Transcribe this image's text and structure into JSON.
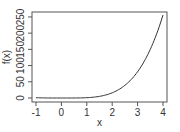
{
  "chart_data": {
    "type": "line",
    "title": "",
    "xlabel": "x",
    "ylabel": "f(x)",
    "xlim": [
      -1,
      4
    ],
    "ylim": [
      0,
      256
    ],
    "x_ticks": [
      -1,
      0,
      1,
      2,
      3,
      4
    ],
    "x_tick_labels": [
      "-1",
      "0",
      "1",
      "2",
      "3",
      "4"
    ],
    "y_ticks": [
      0,
      50,
      100,
      150,
      200,
      250
    ],
    "y_tick_labels": [
      "0",
      "50",
      "100",
      "150",
      "200",
      "250"
    ],
    "grid": false,
    "legend": null,
    "series": [
      {
        "name": "f(x)",
        "color": "#333333",
        "x": [
          -1,
          -0.5,
          0,
          0.5,
          1,
          1.5,
          2,
          2.5,
          3,
          3.5,
          4
        ],
        "values": [
          1,
          0.06,
          0,
          0.06,
          1,
          5.06,
          16,
          39.06,
          81,
          150.06,
          256
        ]
      }
    ]
  }
}
